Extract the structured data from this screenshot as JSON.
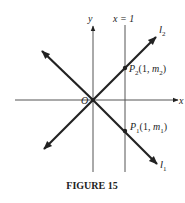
{
  "figure": {
    "caption": "FIGURE 15",
    "axes": {
      "x_label": "x",
      "y_label": "y",
      "origin_label": "O"
    },
    "vertical_line_label": "x = 1",
    "lines": [
      {
        "name": "l2",
        "label_main": "l",
        "label_sub": "2"
      },
      {
        "name": "l1",
        "label_main": "l",
        "label_sub": "1"
      }
    ],
    "points": [
      {
        "name": "P2",
        "label_main": "P",
        "label_sub": "2",
        "coords_prefix": "(1, ",
        "coord_main": "m",
        "coord_sub": "2",
        "coords_suffix": ")"
      },
      {
        "name": "P1",
        "label_main": "P",
        "label_sub": "1",
        "coords_prefix": "(1, ",
        "coord_main": "m",
        "coord_sub": "1",
        "coords_suffix": ")"
      }
    ]
  }
}
